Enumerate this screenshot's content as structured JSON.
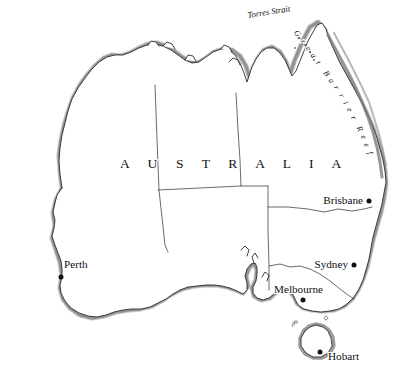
{
  "map": {
    "title": "Australia",
    "country_label": "A U S T R A L I A",
    "background_color": "#ffffff",
    "ink_color": "#1a1a1a",
    "coast_shade_color": "#8a8a8a",
    "border_color": "#3a3a3a",
    "dot_color": "#111111",
    "water_labels": [
      {
        "name": "torres-strait",
        "text": "Torres Strait",
        "x": 248,
        "y": 18,
        "rotation": -9
      }
    ],
    "feature_labels": [
      {
        "name": "great-barrier-reef",
        "text": "Great Barrier Reef"
      }
    ],
    "reef_letters": [
      "G",
      "r",
      "e",
      "a",
      "t",
      "B",
      "a",
      "r",
      "r",
      "i",
      "e",
      "r",
      "R",
      "e",
      "e",
      "f"
    ],
    "cities": [
      {
        "name": "perth",
        "label": "Perth",
        "label_x": 64,
        "label_y": 268,
        "dot_x": 61,
        "dot_y": 277,
        "anchor": "start"
      },
      {
        "name": "brisbane",
        "label": "Brisbane",
        "label_x": 363,
        "label_y": 204,
        "dot_x": 369,
        "dot_y": 201,
        "anchor": "end"
      },
      {
        "name": "sydney",
        "label": "Sydney",
        "label_x": 346,
        "label_y": 268,
        "dot_x": 354,
        "dot_y": 265,
        "anchor": "end"
      },
      {
        "name": "melbourne",
        "label": "Melbourne",
        "label_x": 274,
        "label_y": 292,
        "dot_x": 303,
        "dot_y": 300,
        "anchor": "start"
      },
      {
        "name": "hobart",
        "label": "Hobart",
        "label_x": 330,
        "label_y": 358,
        "dot_x": 320,
        "dot_y": 352,
        "anchor": "start"
      }
    ],
    "internal_borders": [
      {
        "name": "wa-nt-sa-border-vertical"
      },
      {
        "name": "nt-qld-border-vertical"
      },
      {
        "name": "nt-sa-border-horizontal"
      },
      {
        "name": "qld-nsw-border"
      },
      {
        "name": "nsw-vic-border-murray"
      },
      {
        "name": "sa-nsw-vic-border-vertical"
      }
    ],
    "island": {
      "name": "tasmania"
    }
  }
}
